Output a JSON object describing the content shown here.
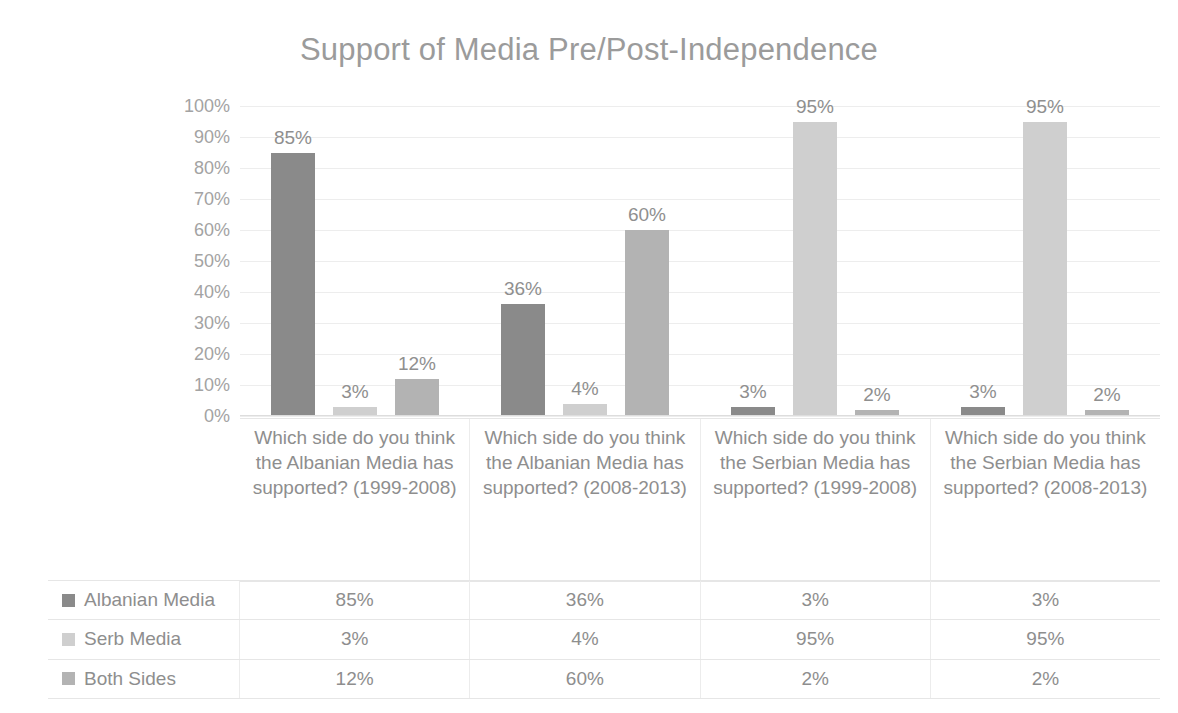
{
  "chart_data": {
    "type": "bar",
    "title": "Support of Media Pre/Post-Independence",
    "xlabel": "",
    "ylabel": "",
    "ylim": [
      0,
      100
    ],
    "grid": true,
    "legend_position": "table-left",
    "ytick_labels": [
      "100%",
      "90%",
      "80%",
      "70%",
      "60%",
      "50%",
      "40%",
      "30%",
      "20%",
      "10%",
      "0%"
    ],
    "ytick_values": [
      100,
      90,
      80,
      70,
      60,
      50,
      40,
      30,
      20,
      10,
      0
    ],
    "categories": [
      "Which side do you think the Albanian Media has supported? (1999-2008)",
      "Which side do you think the Albanian Media has supported? (2008-2013)",
      "Which side do you think the Serbian Media has supported? (1999-2008)",
      "Which side do you think the Serbian Media has supported? (2008-2013)"
    ],
    "series": [
      {
        "name": "Albanian Media",
        "color": "#8a8a8a",
        "values": [
          85,
          36,
          3,
          3
        ],
        "labels": [
          "85%",
          "36%",
          "3%",
          "3%"
        ]
      },
      {
        "name": "Serb Media",
        "color": "#cfcfcf",
        "values": [
          3,
          4,
          95,
          95
        ],
        "labels": [
          "3%",
          "4%",
          "95%",
          "95%"
        ]
      },
      {
        "name": "Both Sides",
        "color": "#b3b3b3",
        "values": [
          12,
          60,
          2,
          2
        ],
        "labels": [
          "12%",
          "60%",
          "2%",
          "2%"
        ]
      }
    ]
  },
  "data_table": {
    "rows": [
      {
        "label": "Albanian Media",
        "color": "#8a8a8a",
        "cells": [
          "85%",
          "36%",
          "3%",
          "3%"
        ]
      },
      {
        "label": "Serb Media",
        "color": "#cfcfcf",
        "cells": [
          "3%",
          "4%",
          "95%",
          "95%"
        ]
      },
      {
        "label": "Both Sides",
        "color": "#b3b3b3",
        "cells": [
          "12%",
          "60%",
          "2%",
          "2%"
        ]
      }
    ]
  }
}
